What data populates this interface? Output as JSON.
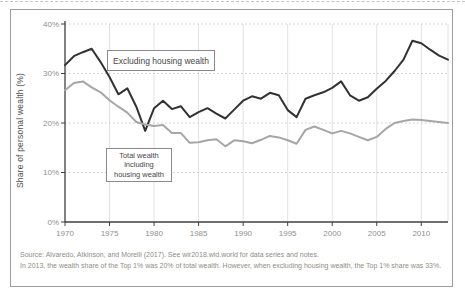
{
  "chart_data": {
    "type": "line",
    "title": "",
    "ylabel": "Share of personal wealth (%)",
    "xlabel": "",
    "xlim": [
      1970,
      2013
    ],
    "ylim": [
      0,
      40
    ],
    "grid": "horizontal dotted, vertical solid",
    "legend_position": "inline boxed annotations",
    "x_ticks": [
      1970,
      1975,
      1980,
      1985,
      1990,
      1995,
      2000,
      2005,
      2010
    ],
    "x_tick_labels": [
      "1970",
      "1975",
      "1980",
      "1985",
      "1990",
      "1995",
      "2000",
      "2005",
      "2010"
    ],
    "x_gridlines": [
      1975,
      1980,
      1985,
      1990,
      1995,
      2000,
      2005,
      2010
    ],
    "y_ticks": [
      0,
      10,
      20,
      30,
      40
    ],
    "y_tick_labels": [
      "0%",
      "10%",
      "20%",
      "30%",
      "40%"
    ],
    "x": [
      1970,
      1971,
      1972,
      1973,
      1974,
      1975,
      1976,
      1977,
      1978,
      1979,
      1980,
      1981,
      1982,
      1983,
      1984,
      1985,
      1986,
      1987,
      1988,
      1989,
      1990,
      1991,
      1992,
      1993,
      1994,
      1995,
      1996,
      1997,
      1998,
      1999,
      2000,
      2001,
      2002,
      2003,
      2004,
      2005,
      2006,
      2007,
      2008,
      2009,
      2010,
      2011,
      2012,
      2013
    ],
    "series": [
      {
        "name": "Excluding housing wealth",
        "color": "#323232",
        "values": [
          31.7,
          33.5,
          34.3,
          35.0,
          32.3,
          29.3,
          25.8,
          27.0,
          23.3,
          18.4,
          23.0,
          24.5,
          22.8,
          23.4,
          21.2,
          22.2,
          23.0,
          21.9,
          20.9,
          22.7,
          24.5,
          25.4,
          24.9,
          26.1,
          25.6,
          22.6,
          21.2,
          24.9,
          25.6,
          26.2,
          27.1,
          28.4,
          25.6,
          24.5,
          25.2,
          26.9,
          28.5,
          30.5,
          32.8,
          36.6,
          36.1,
          34.8,
          33.6,
          32.8
        ]
      },
      {
        "name": "Total wealth including housing wealth",
        "color": "#a6a6a6",
        "values": [
          26.6,
          28.1,
          28.4,
          27.2,
          26.2,
          24.6,
          23.3,
          22.1,
          20.2,
          19.7,
          19.4,
          19.6,
          18.0,
          18.0,
          16.0,
          16.1,
          16.5,
          16.7,
          15.3,
          16.5,
          16.3,
          15.9,
          16.6,
          17.4,
          17.1,
          16.5,
          15.8,
          18.6,
          19.3,
          18.6,
          17.9,
          18.4,
          17.9,
          17.2,
          16.5,
          17.2,
          18.8,
          20.0,
          20.4,
          20.7,
          20.6,
          20.4,
          20.2,
          20.0
        ]
      }
    ],
    "style": {
      "grid_v_color": "#e2e2e2",
      "grid_h_color": "#c8c8c8",
      "spine_color": "#404040",
      "tick_label_color": "#8f8f8f",
      "line_width": 2
    }
  },
  "annotations": {
    "excluding_box": {
      "label": "Excluding housing wealth"
    },
    "total_box": {
      "lines": [
        "Total wealth",
        "including",
        "housing wealth"
      ]
    }
  },
  "footer": {
    "source": "Source: Alvaredo, Atkinson, and Morelli (2017). See wir2018.wid.world for data series and notes.",
    "note": "In 2013, the wealth share of the Top 1% was 20% of total wealth. However, when excluding housing wealth, the Top 1% share was 33%."
  }
}
